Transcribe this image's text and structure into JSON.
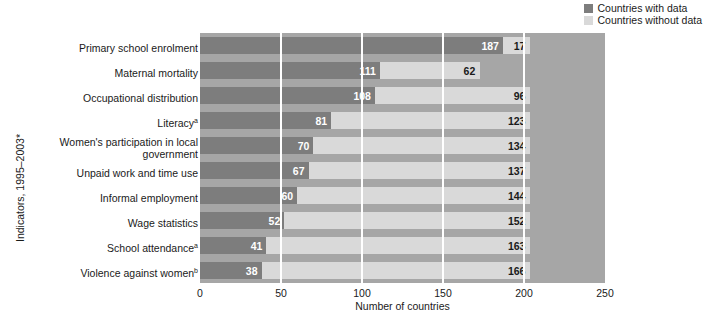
{
  "chart_data": {
    "type": "bar",
    "orientation": "horizontal",
    "stacked": true,
    "title": "",
    "xlabel": "Number of countries",
    "ylabel": "Indicators, 1995–2003*",
    "xlim": [
      0,
      250
    ],
    "xticks": [
      "0",
      "50",
      "100",
      "150",
      "200",
      "250"
    ],
    "xtick_values": [
      0,
      50,
      100,
      150,
      200,
      250
    ],
    "grid": "vertical white gridlines at 50, 100, 150, 200",
    "legend_position": "top-right",
    "categories": [
      "Primary school enrolment",
      "Maternal mortality",
      "Occupational distribution",
      "Literacy",
      "Women's participation in local government",
      "Unpaid work and time use",
      "Informal employment",
      "Wage statistics",
      "School attendance",
      "Violence against women"
    ],
    "category_footnotes": [
      "",
      "",
      "",
      "a",
      "",
      "",
      "",
      "",
      "a",
      "b"
    ],
    "series": [
      {
        "name": "Countries with data",
        "color": "#7d7d7d",
        "values": [
          187,
          111,
          108,
          81,
          70,
          67,
          60,
          52,
          41,
          38
        ]
      },
      {
        "name": "Countries without data",
        "color": "#d9d9d9",
        "values": [
          17,
          62,
          96,
          123,
          134,
          137,
          144,
          152,
          163,
          166
        ]
      }
    ]
  },
  "legend": {
    "items": [
      {
        "label": "Countries with data",
        "color": "#7d7d7d"
      },
      {
        "label": "Countries without data",
        "color": "#d9d9d9"
      }
    ]
  },
  "axes": {
    "y_title": "Indicators, 1995–2003*",
    "x_title": "Number of countries"
  }
}
